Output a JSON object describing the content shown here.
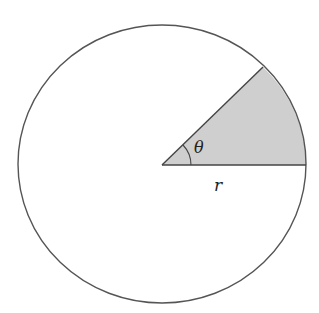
{
  "diagram": {
    "labels": {
      "angle": "θ",
      "radius": "r"
    },
    "geometry": {
      "center": [
        162,
        164
      ],
      "rx": 144,
      "ry": 139,
      "sector_angle_deg": 44,
      "angle_arc_radius": 29
    },
    "colors": {
      "stroke": "#555555",
      "sector_fill": "#cfcfcf",
      "background": "#ffffff"
    }
  }
}
